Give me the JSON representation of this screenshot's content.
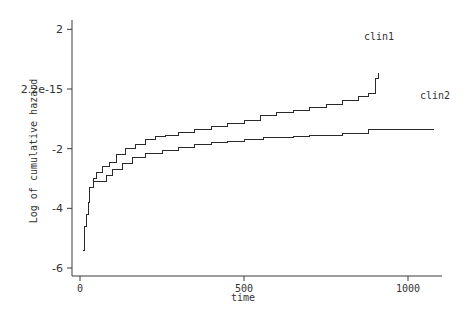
{
  "chart_data": {
    "type": "line",
    "subtype": "step",
    "title": "",
    "xlabel": "time",
    "ylabel": "Log of cumulative hazard",
    "xlim": [
      -5,
      1080
    ],
    "ylim": [
      -6.2,
      2.1
    ],
    "grid": false,
    "legend": "inline labels at line ends",
    "x_ticks": [
      0,
      500,
      1000
    ],
    "x_tick_labels": [
      "0",
      "500",
      "1000"
    ],
    "y_ticks": [
      2,
      0,
      -2,
      -4,
      -6
    ],
    "y_tick_labels": [
      "2",
      "2.2e-15",
      "-2",
      "-4",
      "-6"
    ],
    "series": [
      {
        "name": "clin1",
        "x": [
          10,
          15,
          20,
          25,
          30,
          40,
          50,
          70,
          90,
          110,
          140,
          170,
          200,
          230,
          260,
          300,
          350,
          400,
          450,
          500,
          550,
          600,
          650,
          700,
          750,
          800,
          850,
          880,
          900,
          910
        ],
        "values": [
          -5.4,
          -4.6,
          -4.2,
          -3.8,
          -3.3,
          -3.0,
          -2.8,
          -2.6,
          -2.45,
          -2.2,
          -2.0,
          -1.85,
          -1.7,
          -1.6,
          -1.55,
          -1.45,
          -1.35,
          -1.25,
          -1.15,
          -1.05,
          -0.9,
          -0.8,
          -0.72,
          -0.62,
          -0.52,
          -0.38,
          -0.25,
          -0.15,
          0.35,
          0.55
        ]
      },
      {
        "name": "clin2",
        "x": [
          10,
          15,
          20,
          25,
          30,
          40,
          60,
          80,
          100,
          130,
          160,
          200,
          250,
          300,
          350,
          400,
          450,
          500,
          560,
          650,
          700,
          800,
          880,
          1080
        ],
        "values": [
          -5.4,
          -4.6,
          -4.2,
          -3.8,
          -3.3,
          -3.1,
          -3.1,
          -2.9,
          -2.7,
          -2.5,
          -2.3,
          -2.15,
          -2.05,
          -1.95,
          -1.85,
          -1.8,
          -1.75,
          -1.7,
          -1.62,
          -1.58,
          -1.55,
          -1.5,
          -1.35,
          -1.35
        ]
      }
    ]
  },
  "labels": {
    "xlabel": "time",
    "ylabel": "Log of cumulative hazard",
    "series_label_1": "clin1",
    "series_label_2": "clin2"
  }
}
